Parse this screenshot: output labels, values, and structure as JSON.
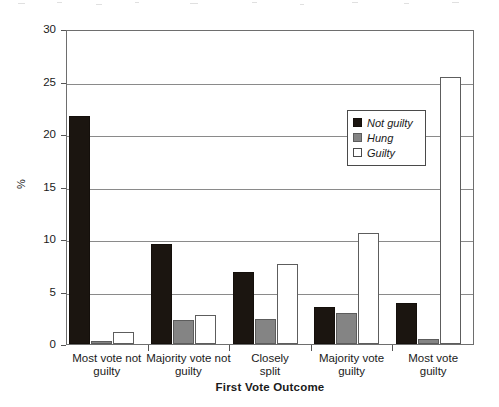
{
  "chart_data": {
    "type": "bar",
    "title": "",
    "xlabel": "First Vote Outcome",
    "ylabel": "%",
    "ylim": [
      0,
      30
    ],
    "yticks": [
      0,
      5,
      10,
      15,
      20,
      25,
      30
    ],
    "grid": true,
    "legend_position": "inside-right",
    "categories": [
      "Most vote not guilty",
      "Majority vote not guilty",
      "Closely split",
      "Majority vote guilty",
      "Most vote guilty"
    ],
    "category_lines": [
      [
        "Most vote not",
        "guilty"
      ],
      [
        "Majority vote not",
        "guilty"
      ],
      [
        "Closely",
        "split"
      ],
      [
        "Majority vote",
        "guilty"
      ],
      [
        "Most vote",
        "guilty"
      ]
    ],
    "series": [
      {
        "name": "Not guilty",
        "color": "#1b1510",
        "values": [
          21.7,
          9.5,
          6.9,
          3.5,
          3.9
        ]
      },
      {
        "name": "Hung",
        "color": "#848484",
        "values": [
          0.3,
          2.3,
          2.4,
          3.0,
          0.5
        ]
      },
      {
        "name": "Guilty",
        "color": "#ffffff",
        "values": [
          1.1,
          2.8,
          7.6,
          10.6,
          25.4
        ]
      }
    ]
  },
  "axes": {
    "y_title": "%",
    "x_title": "First Vote Outcome",
    "y_tick_labels": [
      "0",
      "5",
      "10",
      "15",
      "20",
      "25",
      "30"
    ]
  },
  "legend": {
    "entries": [
      {
        "label": "Not guilty",
        "swatch": "black-square-icon"
      },
      {
        "label": "Hung",
        "swatch": "gray-square-icon"
      },
      {
        "label": "Guilty",
        "swatch": "white-square-icon"
      }
    ]
  }
}
